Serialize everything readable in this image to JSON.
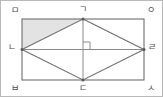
{
  "figure": {
    "type": "geometry-diagram",
    "canvas": {
      "width": 163,
      "height": 97
    },
    "colors": {
      "outer_border": "#b9b9b9",
      "rectangle_stroke": "#6e6e6e",
      "rhombus_stroke": "#6e6e6e",
      "diagonal_stroke": "#8a8a8a",
      "shaded_fill": "#e3e3e3",
      "label_text": "#4a4a4a",
      "background": "#ffffff"
    },
    "rectangle": {
      "x": 21,
      "y": 18,
      "width": 122,
      "height": 61,
      "corner_labels": [
        "ㅁ",
        "ㅇ",
        "ㅅ",
        "ㅂ"
      ]
    },
    "points": [
      {
        "id": "corner-top-left",
        "label": "ㅁ",
        "x": 21,
        "y": 18,
        "label_x": 10,
        "label_y": 5,
        "role": "rectangle-corner"
      },
      {
        "id": "midpoint-top",
        "label": "ㄱ",
        "x": 82,
        "y": 18,
        "label_x": 78,
        "label_y": 4,
        "role": "rhombus-vertex"
      },
      {
        "id": "corner-top-right",
        "label": "ㅇ",
        "x": 143,
        "y": 18,
        "label_x": 146,
        "label_y": 5,
        "role": "rectangle-corner"
      },
      {
        "id": "midpoint-left",
        "label": "ㄴ",
        "x": 21,
        "y": 48.5,
        "label_x": 7,
        "label_y": 42,
        "role": "rhombus-vertex"
      },
      {
        "id": "center",
        "label": "",
        "x": 82,
        "y": 48.5,
        "label_x": 0,
        "label_y": 0,
        "role": "diagonal-intersection"
      },
      {
        "id": "midpoint-right",
        "label": "ㄹ",
        "x": 143,
        "y": 48.5,
        "label_x": 147,
        "label_y": 42,
        "role": "rhombus-vertex"
      },
      {
        "id": "corner-bottom-left",
        "label": "ㅂ",
        "x": 21,
        "y": 79,
        "label_x": 10,
        "label_y": 83,
        "role": "rectangle-corner"
      },
      {
        "id": "midpoint-bottom",
        "label": "ㄷ",
        "x": 82,
        "y": 79,
        "label_x": 78,
        "label_y": 83,
        "role": "rhombus-vertex"
      },
      {
        "id": "corner-bottom-right",
        "label": "ㅅ",
        "x": 143,
        "y": 79,
        "label_x": 146,
        "label_y": 83,
        "role": "rectangle-corner"
      }
    ],
    "rhombus": {
      "vertices": [
        "ㄱ",
        "ㄹ",
        "ㄷ",
        "ㄴ"
      ],
      "path": "M 82 18 L 143 48.5 L 82 79 L 21 48.5 Z"
    },
    "diagonals": [
      {
        "id": "diagonal-vertical",
        "from": "ㄱ",
        "to": "ㄷ",
        "x1": 82,
        "y1": 18,
        "x2": 82,
        "y2": 79
      },
      {
        "id": "diagonal-horizontal",
        "from": "ㄴ",
        "to": "ㄹ",
        "x1": 21,
        "y1": 48.5,
        "x2": 143,
        "y2": 48.5
      }
    ],
    "shaded_region": {
      "id": "shaded-triangle",
      "vertices": [
        "ㅁ",
        "ㄱ",
        "ㄴ"
      ],
      "path": "M 21 18 L 82 18 L 21 48.5 Z"
    },
    "right_angle_mark": {
      "id": "right-angle-mark-center",
      "at": "center",
      "path": "M 82 41 L 89 41 L 89 48.5",
      "size": 7
    },
    "vertex_dots": [
      {
        "x": 82,
        "y": 18
      },
      {
        "x": 21,
        "y": 48.5
      },
      {
        "x": 143,
        "y": 48.5
      },
      {
        "x": 82,
        "y": 79
      }
    ]
  }
}
